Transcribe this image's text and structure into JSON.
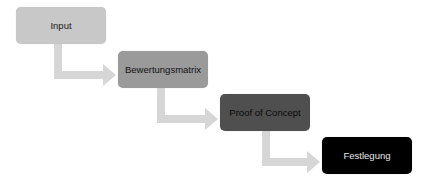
{
  "diagram": {
    "type": "process-flow",
    "steps": [
      {
        "label": "Input",
        "fill": "#c8c8c8",
        "text_color": "#1a1a1a"
      },
      {
        "label": "Bewertungsmatrix",
        "fill": "#9a9a9a",
        "text_color": "#111111"
      },
      {
        "label": "Proof of Concept",
        "fill": "#4f4f4f",
        "text_color": "#0a0a0a"
      },
      {
        "label": "Festlegung",
        "fill": "#000000",
        "text_color": "#e8e8e8"
      }
    ],
    "arrow_color": "#d6d6d6"
  }
}
